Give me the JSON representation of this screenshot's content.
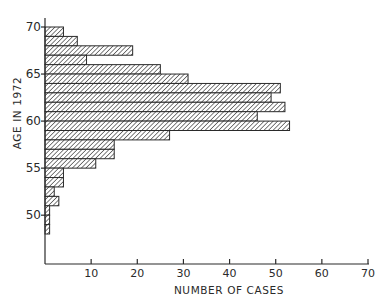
{
  "chart_data": {
    "type": "bar",
    "orientation": "horizontal",
    "title": "",
    "xlabel": "NUMBER OF CASES",
    "ylabel": "AGE IN 1972",
    "xlim": [
      0,
      70
    ],
    "ylim": [
      48,
      70
    ],
    "x_ticks": [
      10,
      20,
      30,
      40,
      50,
      60,
      70
    ],
    "x_tick_labels": [
      "10",
      "20",
      "30",
      "40",
      "50",
      "60",
      "70"
    ],
    "y_ticks": [
      50,
      55,
      60,
      65,
      70
    ],
    "y_tick_labels": [
      "50",
      "55",
      "60",
      "65",
      "70"
    ],
    "categories": [
      69,
      68,
      67,
      66,
      65,
      64,
      63,
      62,
      61,
      60,
      59,
      58,
      57,
      56,
      55,
      54,
      53,
      52,
      51,
      50,
      49,
      48
    ],
    "bin_width": 1,
    "values": [
      4,
      7,
      19,
      9,
      25,
      31,
      51,
      49,
      52,
      46,
      53,
      27,
      15,
      15,
      11,
      4,
      4,
      2,
      3,
      1,
      1,
      1
    ],
    "fill": "diagonal-hatch",
    "grid": false,
    "legend": "none"
  }
}
